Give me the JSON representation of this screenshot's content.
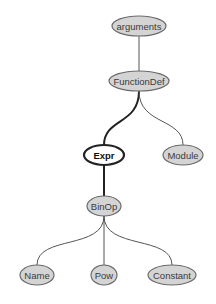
{
  "diagram": {
    "type": "tree",
    "colors": {
      "node_fill": "#d4d4d4",
      "node_stroke": "#6a6a6a",
      "highlight_fill": "#ffffff",
      "highlight_stroke": "#222222",
      "edge": "#555555"
    },
    "nodes": [
      {
        "id": "arguments",
        "label": "arguments",
        "highlighted": false
      },
      {
        "id": "functiondef",
        "label": "FunctionDef",
        "highlighted": false
      },
      {
        "id": "expr",
        "label": "Expr",
        "highlighted": true
      },
      {
        "id": "module",
        "label": "Module",
        "highlighted": false
      },
      {
        "id": "binop",
        "label": "BinOp",
        "highlighted": false
      },
      {
        "id": "name",
        "label": "Name",
        "highlighted": false
      },
      {
        "id": "pow",
        "label": "Pow",
        "highlighted": false
      },
      {
        "id": "constant",
        "label": "Constant",
        "highlighted": false
      }
    ],
    "edges": [
      {
        "from": "arguments",
        "to": "functiondef",
        "bold": false
      },
      {
        "from": "functiondef",
        "to": "expr",
        "bold": true
      },
      {
        "from": "functiondef",
        "to": "module",
        "bold": false
      },
      {
        "from": "expr",
        "to": "binop",
        "bold": true
      },
      {
        "from": "binop",
        "to": "name",
        "bold": false
      },
      {
        "from": "binop",
        "to": "pow",
        "bold": false
      },
      {
        "from": "binop",
        "to": "constant",
        "bold": false
      }
    ]
  }
}
